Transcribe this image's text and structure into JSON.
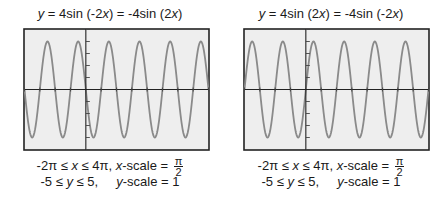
{
  "charts": [
    {
      "title_lhs": "y",
      "title_rest": " = 4sin (-2",
      "title_x1": "x",
      "title_mid": ") = -4sin (2",
      "title_x2": "x",
      "title_end": ")",
      "window": {
        "xrange_pre": "-2π ≤ ",
        "xvar": "x",
        "xrange_post": " ≤ 4π,  ",
        "xscale_var": "x",
        "xscale_label": "-scale = ",
        "xscale_num": "π",
        "xscale_den": "2",
        "yrange_pre": "-5 ≤ ",
        "yvar": "y",
        "yrange_post": " ≤ 5,     ",
        "yscale_var": "y",
        "yscale_label": "-scale = 1"
      }
    },
    {
      "title_lhs": "y",
      "title_rest": " = 4sin (2",
      "title_x1": "x",
      "title_mid": ") = -4sin (-2",
      "title_x2": "x",
      "title_end": ")",
      "window": {
        "xrange_pre": "-2π ≤ ",
        "xvar": "x",
        "xrange_post": " ≤ 4π,  ",
        "xscale_var": "x",
        "xscale_label": "-scale = ",
        "xscale_num": "π",
        "xscale_den": "2",
        "yrange_pre": "-5 ≤ ",
        "yvar": "y",
        "yrange_post": " ≤ 5,     ",
        "yscale_var": "y",
        "yscale_label": "-scale = 1"
      }
    }
  ],
  "chart_data": [
    {
      "type": "line",
      "title": "y = 4sin (-2x) = -4sin (2x)",
      "function": "y = -4*sin(2x)",
      "amplitude": 4,
      "period": "π",
      "xlim": [
        "-2π",
        "4π"
      ],
      "ylim": [
        -5,
        5
      ],
      "xscale": "π/2",
      "yscale": 1,
      "grid": false,
      "line_color": "#8a8a8a",
      "background": "#eeeeee"
    },
    {
      "type": "line",
      "title": "y = 4sin (2x) = -4sin (-2x)",
      "function": "y = 4*sin(2x)",
      "amplitude": 4,
      "period": "π",
      "xlim": [
        "-2π",
        "4π"
      ],
      "ylim": [
        -5,
        5
      ],
      "xscale": "π/2",
      "yscale": 1,
      "grid": false,
      "line_color": "#8a8a8a",
      "background": "#eeeeee"
    }
  ]
}
